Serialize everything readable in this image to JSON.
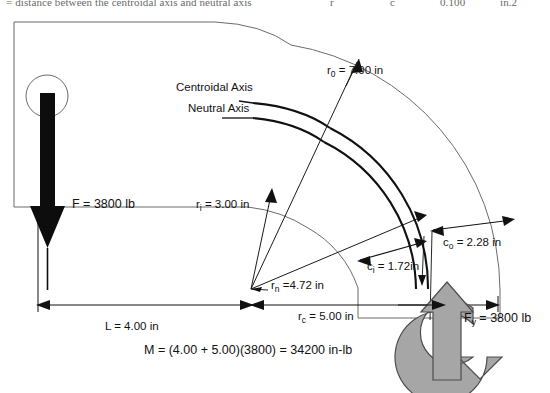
{
  "figure": {
    "title_strip": {
      "left": "= distance between the centroidal axis and neutral axis",
      "mid": "r",
      "r1": "c",
      "r2": "0.100",
      "r3": "in.2",
      "r4": "0.25"
    },
    "labels": {
      "centroidal_axis": "Centroidal Axis",
      "neutral_axis": "Neutral Axis",
      "r_outer": "r₀ = 7.00 in",
      "r_inner": "rᵢ = 3.00 in",
      "r_neutral": "rₙ =4.72 in",
      "r_centroid": "rᴄ = 5.00 in",
      "c_outer": "cₒ = 2.28 in",
      "c_inner": "cᵢ = 1.72in",
      "force_F": "F = 3800 lb",
      "force_Fy": "Fᵧ = 3800 lb",
      "length_L": "L = 4.00 in",
      "moment": "M = (4.00 + 5.00)(3800) = 34200 in-lb"
    },
    "label_parts": {
      "r_outer": {
        "base": "r",
        "sub": "0",
        "rest": " = 7.00 in"
      },
      "r_inner": {
        "base": "r",
        "sub": "i",
        "rest": " = 3.00 in"
      },
      "r_neutral": {
        "base": "r",
        "sub": "n",
        "rest": " =4.72 in"
      },
      "r_centroid": {
        "base": "r",
        "sub": "c",
        "rest": " = 5.00 in"
      },
      "c_outer": {
        "base": "c",
        "sub": "o",
        "rest": " = 2.28 in"
      },
      "c_inner": {
        "base": "c",
        "sub": "i",
        "rest": " = 1.72in"
      },
      "force_F": {
        "base": "F",
        "sub": "",
        "rest": " = 3800 lb"
      },
      "force_Fy": {
        "base": "F",
        "sub": "y",
        "rest": " = 3800 lb"
      },
      "length_L": {
        "base": "L",
        "sub": "",
        "rest": " = 4.00 in"
      },
      "moment": {
        "base": "M",
        "sub": "",
        "rest": " = (4.00 + 5.00)(3800) = 34200 in-lb"
      }
    },
    "values": {
      "r_outer_in": 7.0,
      "r_inner_in": 3.0,
      "r_neutral_in": 4.72,
      "r_centroid_in": 5.0,
      "c_outer_in": 2.28,
      "c_inner_in": 1.72,
      "F_lb": 3800,
      "Fy_lb": 3800,
      "L_in": 4.0,
      "M_in_lb": 34200
    },
    "colors": {
      "line": "#1a1a1a",
      "thin_line": "#555555",
      "gray_arrow_fill": "#a6a6a6",
      "gray_arrow_stroke": "#4d4d4d",
      "black_arrow": "#000000",
      "background": "#ffffff"
    },
    "icons": {
      "hole": "circle-hole",
      "force_arrow": "down-arrow-icon",
      "reaction_arrow": "up-arrow-icon",
      "moment_arrow": "curved-moment-arrow-icon"
    }
  }
}
